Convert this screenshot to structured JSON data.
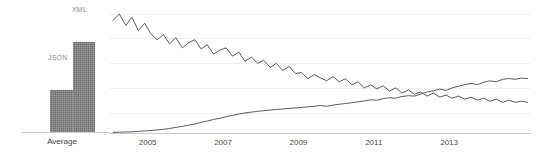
{
  "chart_data": [
    {
      "type": "bar",
      "name": "average-bar-chart",
      "title": "",
      "xlabel": "",
      "ylabel": "",
      "categories": [
        "Average"
      ],
      "category_label": "Average",
      "grid": false,
      "legend_position": "above-bars",
      "bars": [
        {
          "label": "JSON",
          "value": 24,
          "color": "#6e6e6e"
        },
        {
          "label": "XML",
          "value": 52,
          "color": "#6e6e6e"
        }
      ],
      "ylim": [
        0,
        60
      ]
    },
    {
      "type": "line",
      "name": "trend-line-chart",
      "title": "",
      "xlabel": "",
      "ylabel": "",
      "grid": true,
      "gridline_count": 5,
      "legend_position": "none",
      "xlim": [
        2004.0,
        2015.2
      ],
      "ylim": [
        0,
        60
      ],
      "tick_labels": [
        "2005",
        "2007",
        "2009",
        "2011",
        "2013"
      ],
      "tick_values": [
        2005,
        2007,
        2009,
        2011,
        2013
      ],
      "series": [
        {
          "name": "XML",
          "color": "#5a5a5a",
          "x": [
            2004.08,
            2004.25,
            2004.42,
            2004.58,
            2004.75,
            2004.92,
            2005.08,
            2005.25,
            2005.42,
            2005.58,
            2005.75,
            2005.92,
            2006.08,
            2006.25,
            2006.42,
            2006.58,
            2006.75,
            2006.92,
            2007.08,
            2007.25,
            2007.42,
            2007.58,
            2007.75,
            2007.92,
            2008.08,
            2008.25,
            2008.42,
            2008.58,
            2008.75,
            2008.92,
            2009.08,
            2009.25,
            2009.42,
            2009.58,
            2009.75,
            2009.92,
            2010.08,
            2010.25,
            2010.42,
            2010.58,
            2010.75,
            2010.92,
            2011.08,
            2011.25,
            2011.42,
            2011.58,
            2011.75,
            2011.92,
            2012.08,
            2012.25,
            2012.42,
            2012.58,
            2012.75,
            2012.92,
            2013.08,
            2013.25,
            2013.42,
            2013.58,
            2013.75,
            2013.92,
            2014.08,
            2014.25,
            2014.42,
            2014.58,
            2014.75,
            2014.92,
            2015.08
          ],
          "y": [
            55.0,
            58.0,
            52.5,
            56.5,
            50.0,
            53.5,
            48.5,
            45.5,
            48.0,
            43.5,
            46.5,
            41.5,
            44.0,
            45.5,
            41.0,
            43.0,
            38.5,
            40.5,
            41.5,
            37.5,
            39.5,
            35.0,
            37.0,
            34.0,
            35.5,
            32.0,
            34.0,
            30.5,
            32.5,
            29.0,
            29.5,
            26.5,
            28.5,
            27.0,
            25.5,
            27.5,
            25.0,
            26.5,
            23.5,
            25.0,
            22.0,
            23.5,
            21.5,
            23.0,
            20.5,
            22.0,
            19.5,
            21.0,
            19.0,
            20.0,
            18.0,
            19.5,
            17.5,
            18.5,
            17.0,
            18.0,
            16.5,
            17.5,
            16.0,
            17.0,
            15.5,
            16.5,
            15.0,
            16.0,
            15.0,
            15.5,
            15.0
          ]
        },
        {
          "name": "JSON",
          "color": "#5a5a5a",
          "x": [
            2004.08,
            2004.25,
            2004.42,
            2004.58,
            2004.75,
            2004.92,
            2005.08,
            2005.25,
            2005.42,
            2005.58,
            2005.75,
            2005.92,
            2006.08,
            2006.25,
            2006.42,
            2006.58,
            2006.75,
            2006.92,
            2007.08,
            2007.25,
            2007.42,
            2007.58,
            2007.75,
            2007.92,
            2008.08,
            2008.25,
            2008.42,
            2008.58,
            2008.75,
            2008.92,
            2009.08,
            2009.25,
            2009.42,
            2009.58,
            2009.75,
            2009.92,
            2010.08,
            2010.25,
            2010.42,
            2010.58,
            2010.75,
            2010.92,
            2011.08,
            2011.25,
            2011.42,
            2011.58,
            2011.75,
            2011.92,
            2012.08,
            2012.25,
            2012.42,
            2012.58,
            2012.75,
            2012.92,
            2013.08,
            2013.25,
            2013.42,
            2013.58,
            2013.75,
            2013.92,
            2014.08,
            2014.25,
            2014.42,
            2014.58,
            2014.75,
            2014.92,
            2015.08
          ],
          "y": [
            0.3,
            0.4,
            0.5,
            0.6,
            0.8,
            1.0,
            1.2,
            1.5,
            1.8,
            2.2,
            2.8,
            3.2,
            3.8,
            4.4,
            5.2,
            5.8,
            6.6,
            7.2,
            8.0,
            8.6,
            9.2,
            9.8,
            10.2,
            10.6,
            10.9,
            11.2,
            11.5,
            11.7,
            12.0,
            12.2,
            12.5,
            12.8,
            13.0,
            13.4,
            13.0,
            13.6,
            14.0,
            14.4,
            14.8,
            15.2,
            15.6,
            16.2,
            16.0,
            16.8,
            17.2,
            17.0,
            17.8,
            18.2,
            18.0,
            19.0,
            20.0,
            20.6,
            21.4,
            20.8,
            22.0,
            22.8,
            23.6,
            24.2,
            23.6,
            24.8,
            25.4,
            25.0,
            26.2,
            26.6,
            26.2,
            26.8,
            26.6
          ]
        }
      ]
    }
  ],
  "bar_chart": {
    "category_label": "Average",
    "bars": [
      {
        "label": "JSON"
      },
      {
        "label": "XML"
      }
    ]
  },
  "line_chart": {
    "ticks": [
      {
        "label": "2005"
      },
      {
        "label": "2007"
      },
      {
        "label": "2009"
      },
      {
        "label": "2011"
      },
      {
        "label": "2013"
      }
    ]
  },
  "colors": {
    "bar_fill": "#6e6e6e",
    "line_stroke": "#5a5a5a",
    "gridline": "#efefef",
    "axis": "#c9c9c9",
    "label_text": "#8a8a8a",
    "tick_text": "#4a4a4a"
  }
}
